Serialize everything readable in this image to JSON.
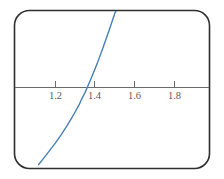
{
  "figure": {
    "frame": {
      "shape": "rounded-rectangle",
      "border_color": "#2e2e2e",
      "background_color": "#ffffff"
    },
    "axis": {
      "color": "#6b6b6b",
      "orientation": "horizontal",
      "tick_labels": [
        "1.2",
        "1.4",
        "1.6",
        "1.8"
      ]
    },
    "curve": {
      "color": "#4a7fb5"
    }
  },
  "chart_data": {
    "type": "line",
    "title": "",
    "subtitle": "",
    "xlabel": "",
    "ylabel": "",
    "grid": false,
    "legend": null,
    "xlim": [
      1.1,
      1.99
    ],
    "ylim": [
      -1.05,
      1.25
    ],
    "xticks": [
      1.2,
      1.4,
      1.6,
      1.8
    ],
    "xtick_labels": [
      "1.2",
      "1.4",
      "1.6",
      "1.8"
    ],
    "yticks": [],
    "ytick_labels": [],
    "axis_y_value": 0,
    "annotations": [
      {
        "text": "root",
        "x": 1.33,
        "y": 0,
        "visible": false
      }
    ],
    "series": [
      {
        "name": "curve",
        "color": "#4a7fb5",
        "style": "solid",
        "width": 1.4,
        "x": [
          1.115,
          1.14,
          1.17,
          1.2,
          1.23,
          1.26,
          1.29,
          1.32,
          1.33,
          1.35,
          1.38,
          1.41,
          1.44,
          1.47,
          1.5,
          1.53,
          1.56
        ],
        "y": [
          -1.0,
          -0.92,
          -0.82,
          -0.72,
          -0.61,
          -0.49,
          -0.36,
          -0.22,
          -0.16,
          -0.06,
          0.12,
          0.31,
          0.52,
          0.74,
          0.97,
          1.12,
          1.22
        ]
      }
    ]
  }
}
